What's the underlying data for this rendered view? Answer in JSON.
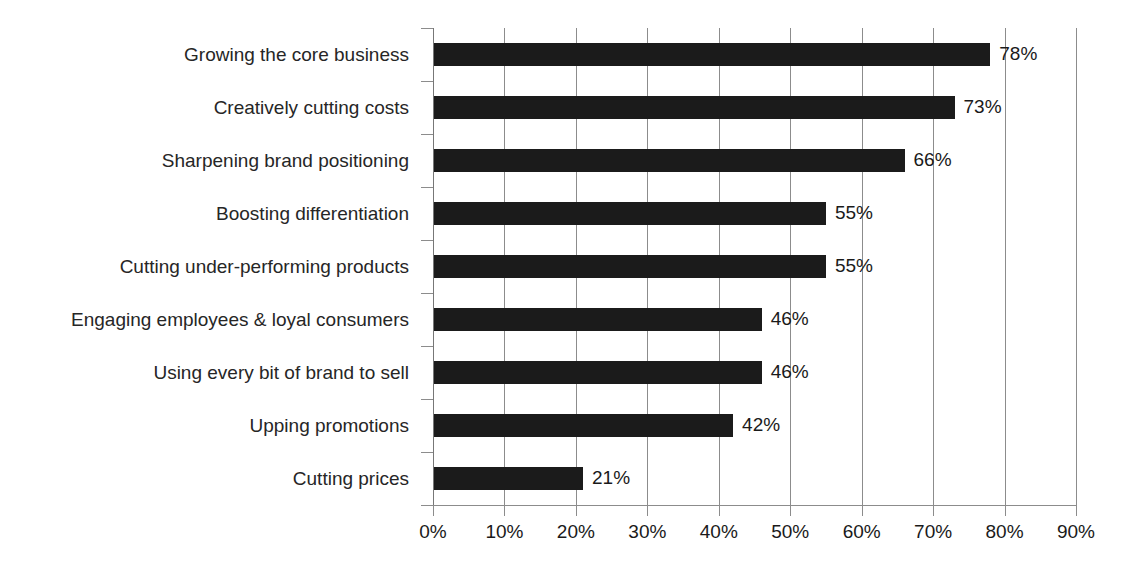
{
  "chart_data": {
    "type": "bar",
    "orientation": "horizontal",
    "title": "",
    "subtitle": "",
    "xlabel": "",
    "ylabel": "",
    "xlim": [
      0,
      90
    ],
    "xtick_step": 10,
    "grid": true,
    "legend": false,
    "legend_position": "none",
    "bar_color": "#1b1b1b",
    "grid_color": "#8c8c8c",
    "text_color": "#1a1a1a",
    "value_suffix": "%",
    "categories": [
      "Growing the core business",
      "Creatively cutting costs",
      "Sharpening brand positioning",
      "Boosting differentiation",
      "Cutting under-performing products",
      "Engaging employees & loyal consumers",
      "Using every bit of brand to sell",
      "Upping promotions",
      "Cutting prices"
    ],
    "values": [
      78,
      73,
      66,
      55,
      55,
      46,
      46,
      42,
      21
    ],
    "data_labels": [
      "78%",
      "73%",
      "66%",
      "55%",
      "55%",
      "46%",
      "46%",
      "42%",
      "21%"
    ],
    "xticks": [
      0,
      10,
      20,
      30,
      40,
      50,
      60,
      70,
      80,
      90
    ],
    "xtick_labels": [
      "0%",
      "10%",
      "20%",
      "30%",
      "40%",
      "50%",
      "60%",
      "70%",
      "80%",
      "90%"
    ]
  }
}
